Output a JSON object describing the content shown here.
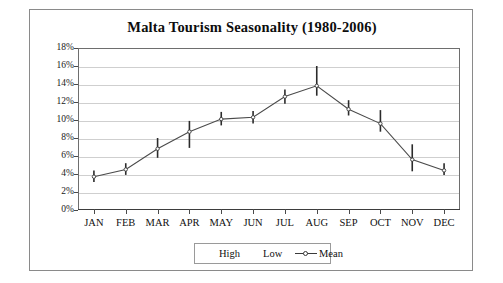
{
  "chart": {
    "title": "Malta Tourism Seasonality (1980-2006)",
    "y_axis_title": "Monthly percentage of annual total",
    "legend": {
      "high_label": "High",
      "low_label": "Low",
      "mean_label": "Mean"
    }
  },
  "chart_data": {
    "type": "line",
    "title": "Malta Tourism Seasonality (1980-2006)",
    "xlabel": "",
    "ylabel": "Monthly percentage of annual total",
    "ylim": [
      0,
      18
    ],
    "ytick_labels": [
      "0%",
      "2%",
      "4%",
      "6%",
      "8%",
      "10%",
      "12%",
      "14%",
      "16%",
      "18%"
    ],
    "ytick_values": [
      0,
      2,
      4,
      6,
      8,
      10,
      12,
      14,
      16,
      18
    ],
    "grid": true,
    "legend_position": "bottom",
    "categories": [
      "JAN",
      "FEB",
      "MAR",
      "APR",
      "MAY",
      "JUN",
      "JUL",
      "AUG",
      "SEP",
      "OCT",
      "NOV",
      "DEC"
    ],
    "series": [
      {
        "name": "Mean",
        "values": [
          3.7,
          4.5,
          6.8,
          8.7,
          10.1,
          10.3,
          12.6,
          13.8,
          11.2,
          9.6,
          5.6,
          4.4
        ]
      },
      {
        "name": "High",
        "values": [
          4.4,
          5.2,
          8.0,
          9.9,
          10.9,
          11.0,
          13.4,
          16.0,
          12.2,
          11.1,
          7.3,
          5.2
        ]
      },
      {
        "name": "Low",
        "values": [
          3.1,
          3.9,
          5.8,
          6.9,
          9.4,
          9.6,
          11.8,
          12.7,
          10.5,
          8.7,
          4.3,
          3.9
        ]
      }
    ]
  }
}
